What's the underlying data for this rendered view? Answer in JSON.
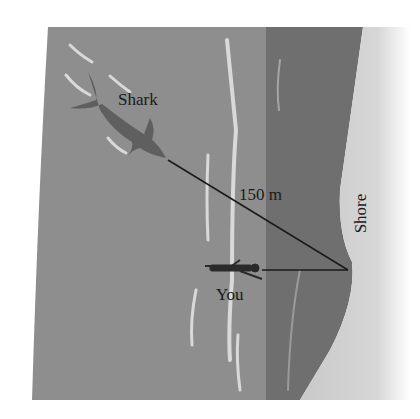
{
  "diagram": {
    "labels": {
      "shark": "Shark",
      "distance": "150 m",
      "shore": "Shore",
      "you": "You"
    },
    "points": {
      "shark": [
        168,
        160
      ],
      "you": [
        262,
        270
      ],
      "shore_point": [
        348,
        270
      ]
    },
    "colors": {
      "open_water": "#8e8e8e",
      "deep_band": "#6e6e6e",
      "shore_sand": "#cfcfcf",
      "foam": "#d8d8d8",
      "line": "#1a1a1a",
      "text": "#1a1a1a"
    }
  }
}
